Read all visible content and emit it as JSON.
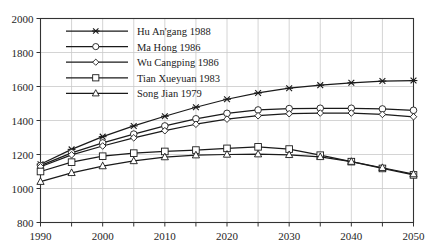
{
  "chart_data": {
    "type": "line",
    "title": "",
    "subtitle": "",
    "xlabel": "",
    "ylabel": "",
    "xlim": [
      1990,
      2050
    ],
    "ylim": [
      800,
      2000
    ],
    "grid": true,
    "legend_position": "top-left",
    "x": [
      1990,
      1995,
      2000,
      2005,
      2010,
      2015,
      2020,
      2025,
      2030,
      2035,
      2040,
      2045,
      2050
    ],
    "xticks": [
      1990,
      2000,
      2010,
      2020,
      2030,
      2040,
      2050
    ],
    "xticklabels": [
      "1990",
      "2000",
      "2010",
      "2020",
      "2030",
      "2040",
      "2050"
    ],
    "xminorticks": [
      1995,
      2005,
      2015,
      2025,
      2035,
      2045
    ],
    "yticks": [
      800,
      1000,
      1200,
      1400,
      1600,
      1800,
      2000
    ],
    "yticklabels": [
      "800",
      "1000",
      "1200",
      "1400",
      "1600",
      "1800",
      "2000"
    ],
    "series": [
      {
        "name": "Hu An'gang 1988",
        "marker": "x-cross",
        "color": "#1a1a1a",
        "values": [
          1143,
          1230,
          1305,
          1368,
          1425,
          1478,
          1525,
          1562,
          1590,
          1608,
          1622,
          1632,
          1635
        ]
      },
      {
        "name": "Ma Hong 1986",
        "marker": "circle",
        "color": "#1a1a1a",
        "values": [
          1135,
          1210,
          1268,
          1320,
          1368,
          1410,
          1442,
          1462,
          1470,
          1472,
          1472,
          1468,
          1460
        ]
      },
      {
        "name": "Wu Cangping 1986",
        "marker": "diamond",
        "color": "#1a1a1a",
        "values": [
          1128,
          1198,
          1250,
          1298,
          1340,
          1378,
          1408,
          1428,
          1440,
          1444,
          1444,
          1436,
          1422
        ]
      },
      {
        "name": "Tian Xueyuan 1983",
        "marker": "square",
        "color": "#1a1a1a",
        "values": [
          1100,
          1155,
          1190,
          1208,
          1218,
          1226,
          1236,
          1245,
          1232,
          1196,
          1158,
          1118,
          1080
        ]
      },
      {
        "name": "Song Jian 1979",
        "marker": "triangle",
        "color": "#1a1a1a",
        "values": [
          1040,
          1092,
          1132,
          1162,
          1185,
          1196,
          1200,
          1202,
          1198,
          1186,
          1158,
          1122,
          1085
        ]
      }
    ]
  },
  "legend": {
    "entries": [
      {
        "label": "Hu An'gang 1988",
        "marker": "x-cross"
      },
      {
        "label": "Ma Hong 1986",
        "marker": "circle"
      },
      {
        "label": "Wu Cangping 1986",
        "marker": "diamond"
      },
      {
        "label": "Tian Xueyuan 1983",
        "marker": "square"
      },
      {
        "label": "Song Jian 1979",
        "marker": "triangle"
      }
    ]
  },
  "style": {
    "line_color": "#1a1a1a",
    "grid_color": "#c9c9c9",
    "axis_color": "#333333",
    "background": "#ffffff",
    "marker_fill": "#ffffff"
  }
}
